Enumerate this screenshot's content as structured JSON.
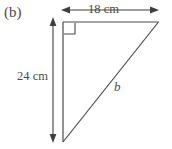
{
  "figure": {
    "part_label": "(b)",
    "background_color": "#ffffff",
    "stroke_color": "#4a4a4a",
    "text_color": "#4a4a4a",
    "shape": "right-triangle",
    "right_angle_vertex": "top-left",
    "right_angle_marker": true
  },
  "labels": {
    "top_dimension": "18 cm",
    "left_dimension": "24 cm",
    "hypotenuse": "b"
  },
  "measurements": {
    "top_side_value": 18,
    "left_side_value": 24,
    "units": "cm",
    "unknown_side": "b"
  },
  "geometry": {
    "triangle_points": "63,22 158,22 63,142",
    "vertical_side": {
      "x1": 63,
      "y1": 22,
      "x2": 63,
      "y2": 142
    },
    "horizontal_side": {
      "x1": 63,
      "y1": 22,
      "x2": 158,
      "y2": 22
    },
    "hypotenuse": {
      "x1": 63,
      "y1": 142,
      "x2": 158,
      "y2": 22
    },
    "right_angle_square": {
      "x": 64,
      "y": 23,
      "size": 11
    },
    "top_dim_arrow": {
      "x1": 62,
      "y": 10,
      "x2": 158
    },
    "left_dim_arrow": {
      "x": 53,
      "y1": 18,
      "y2": 142
    }
  }
}
